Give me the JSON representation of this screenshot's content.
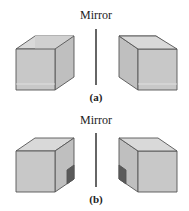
{
  "figure": {
    "panels": [
      {
        "id": "a",
        "mirror_label": "Mirror",
        "panel_label": "(a)",
        "description": "Plain cube and its mirror image (identical/superimposable)"
      },
      {
        "id": "b",
        "mirror_label": "Mirror",
        "panel_label": "(b)",
        "description": "Cube with a dark square on one side face and its mirror image (non-superimposable)"
      }
    ],
    "colors": {
      "face_front": "#c9c9c9",
      "face_side": "#bdbdbd",
      "face_inner": "#d6d6d6",
      "edge": "#555555",
      "mirror_line": "#333333",
      "marker": "#555555"
    }
  }
}
